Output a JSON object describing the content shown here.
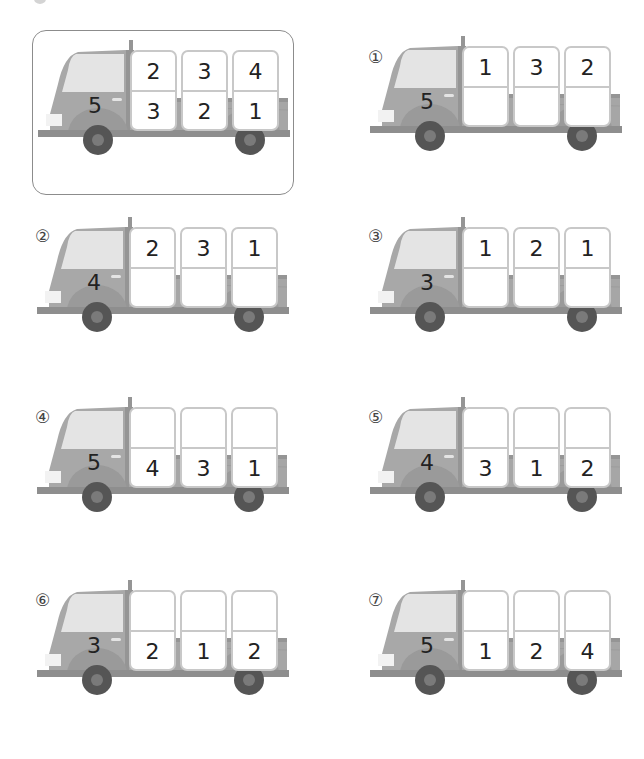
{
  "colors": {
    "cab": "#a8a8a8",
    "body": "#a6a6a6",
    "window": "#e4e4e4",
    "pillar": "#959595",
    "bumper": "#8e8e8e",
    "wheel_arch": "#9a9a9a",
    "tire": "#555555",
    "hub": "#7a7a7a",
    "headlight": "#f2f2f2",
    "box_border": "#c8c8c8"
  },
  "example": {
    "cab": "5",
    "columns": [
      {
        "top": "2",
        "bottom": "3"
      },
      {
        "top": "3",
        "bottom": "2"
      },
      {
        "top": "4",
        "bottom": "1"
      }
    ]
  },
  "problems": [
    {
      "label": "①",
      "cab": "5",
      "columns": [
        {
          "top": "1",
          "bottom": ""
        },
        {
          "top": "3",
          "bottom": ""
        },
        {
          "top": "2",
          "bottom": ""
        }
      ]
    },
    {
      "label": "②",
      "cab": "4",
      "columns": [
        {
          "top": "2",
          "bottom": ""
        },
        {
          "top": "3",
          "bottom": ""
        },
        {
          "top": "1",
          "bottom": ""
        }
      ]
    },
    {
      "label": "③",
      "cab": "3",
      "columns": [
        {
          "top": "1",
          "bottom": ""
        },
        {
          "top": "2",
          "bottom": ""
        },
        {
          "top": "1",
          "bottom": ""
        }
      ]
    },
    {
      "label": "④",
      "cab": "5",
      "columns": [
        {
          "top": "",
          "bottom": "4"
        },
        {
          "top": "",
          "bottom": "3"
        },
        {
          "top": "",
          "bottom": "1"
        }
      ]
    },
    {
      "label": "⑤",
      "cab": "4",
      "columns": [
        {
          "top": "",
          "bottom": "3"
        },
        {
          "top": "",
          "bottom": "1"
        },
        {
          "top": "",
          "bottom": "2"
        }
      ]
    },
    {
      "label": "⑥",
      "cab": "3",
      "columns": [
        {
          "top": "",
          "bottom": "2"
        },
        {
          "top": "",
          "bottom": "1"
        },
        {
          "top": "",
          "bottom": "2"
        }
      ]
    },
    {
      "label": "⑦",
      "cab": "5",
      "columns": [
        {
          "top": "",
          "bottom": "1"
        },
        {
          "top": "",
          "bottom": "2"
        },
        {
          "top": "",
          "bottom": "4"
        }
      ]
    }
  ]
}
